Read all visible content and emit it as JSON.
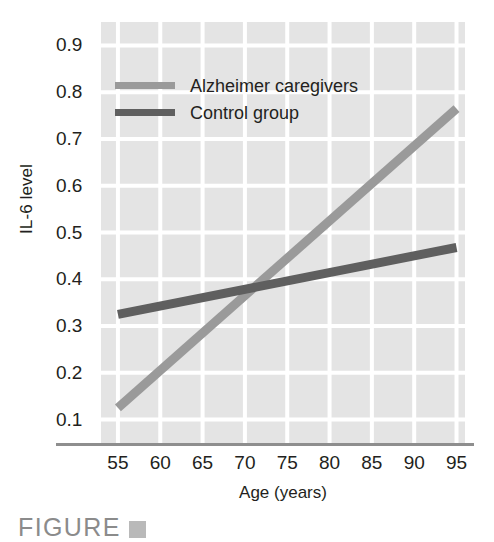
{
  "figure": {
    "caption_text": "FIGURE",
    "caption_marker": ""
  },
  "chart_data": {
    "type": "line",
    "title": "",
    "xlabel": "Age (years)",
    "ylabel": "IL-6 level",
    "xlim": [
      53,
      96
    ],
    "ylim": [
      0.05,
      0.95
    ],
    "x_ticks": [
      55,
      60,
      65,
      70,
      75,
      80,
      85,
      90,
      95
    ],
    "x_tick_labels": [
      "55",
      "60",
      "65",
      "70",
      "75",
      "80",
      "85",
      "90",
      "95"
    ],
    "y_ticks": [
      0.1,
      0.2,
      0.3,
      0.4,
      0.5,
      0.6,
      0.7,
      0.8,
      0.9
    ],
    "y_tick_labels": [
      "0.1",
      "0.2",
      "0.3",
      "0.4",
      "0.5",
      "0.6",
      "0.7",
      "0.8",
      "0.9"
    ],
    "grid": true,
    "grid_color": "#ffffff",
    "plot_background": "#e4e4e4",
    "legend_position": "upper-left-inside",
    "series": [
      {
        "name": "Alzheimer caregivers",
        "color": "#9a9a9a",
        "x": [
          55,
          95
        ],
        "y": [
          0.125,
          0.765
        ]
      },
      {
        "name": "Control group",
        "color": "#5f5f5f",
        "x": [
          55,
          95
        ],
        "y": [
          0.325,
          0.468
        ]
      }
    ],
    "annotations": [
      "Lines cross at approximately age 71, IL-6 level 0.383"
    ]
  },
  "legend": {
    "items": [
      {
        "label": "Alzheimer caregivers",
        "color": "#9a9a9a"
      },
      {
        "label": "Control group",
        "color": "#5f5f5f"
      }
    ]
  },
  "axes": {
    "x_title": "Age (years)",
    "y_title": "IL-6 level",
    "axis_line_color": "#8e8e8e"
  }
}
